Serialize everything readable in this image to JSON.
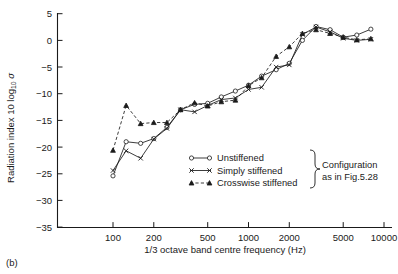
{
  "figure": {
    "panel_label": "(b)"
  },
  "chart_data": {
    "type": "line",
    "title": "",
    "xlabel": "1/3 octave band centre frequency (Hz)",
    "ylabel": "Radiation index 10 log10 σ",
    "ylabel_parts": {
      "prefix": "Radiation index 10 log",
      "subscript": "10",
      "symbol": "σ"
    },
    "xscale": "log",
    "xlim": [
      80,
      11000
    ],
    "ylim": [
      -35,
      5
    ],
    "yticks": [
      5,
      0,
      -5,
      -10,
      -15,
      -20,
      -25,
      -30,
      -35
    ],
    "ytick_labels": [
      "5",
      "0",
      "−5",
      "−10",
      "−15",
      "−20",
      "−25",
      "−30",
      "−35"
    ],
    "xticks": [
      100,
      200,
      500,
      1000,
      2000,
      5000,
      10000
    ],
    "xtick_labels": [
      "100",
      "200",
      "500",
      "1000",
      "2000",
      "5000",
      "10000"
    ],
    "grid": false,
    "legend_position": "lower-right-inside",
    "x": [
      100,
      125,
      160,
      200,
      250,
      315,
      400,
      500,
      630,
      800,
      1000,
      1250,
      1600,
      2000,
      2500,
      3150,
      4000,
      5000,
      6300,
      8000
    ],
    "series": [
      {
        "name": "Unstiffened",
        "marker": "circle",
        "linestyle": "solid",
        "values": [
          -25.4,
          -19.0,
          -19.3,
          -18.4,
          -16.3,
          -13.0,
          -12.0,
          -11.8,
          -10.6,
          -9.5,
          -8.4,
          -6.7,
          -5.5,
          -4.3,
          0.0,
          2.6,
          2.0,
          0.6,
          1.0,
          2.1
        ]
      },
      {
        "name": "Simply stiffened",
        "marker": "x",
        "linestyle": "solid",
        "values": [
          -24.4,
          -20.7,
          -22.1,
          -18.5,
          -16.5,
          -13.0,
          -13.4,
          -12.2,
          -11.1,
          -10.8,
          -9.2,
          -8.8,
          -5.0,
          -4.6,
          1.1,
          2.5,
          1.6,
          0.4,
          0.0,
          0.2
        ]
      },
      {
        "name": "Crosswise stiffened",
        "marker": "triangle",
        "linestyle": "dashed",
        "values": [
          -20.6,
          -12.2,
          -15.6,
          -15.4,
          -15.4,
          -13.0,
          -11.7,
          -12.3,
          -11.5,
          -11.2,
          -8.5,
          -7.0,
          -3.0,
          -1.2,
          1.3,
          2.0,
          1.3,
          0.6,
          0.1,
          0.3
        ]
      }
    ],
    "legend": [
      {
        "label": "Unstiffened",
        "marker": "circle",
        "linestyle": "solid"
      },
      {
        "label": "Simply stiffened",
        "marker": "x",
        "linestyle": "solid"
      },
      {
        "label": "Crosswise stiffened",
        "marker": "triangle",
        "linestyle": "dashed"
      }
    ],
    "annotation": {
      "line1": "Configuration",
      "line2": "as in Fig.5.28"
    }
  }
}
